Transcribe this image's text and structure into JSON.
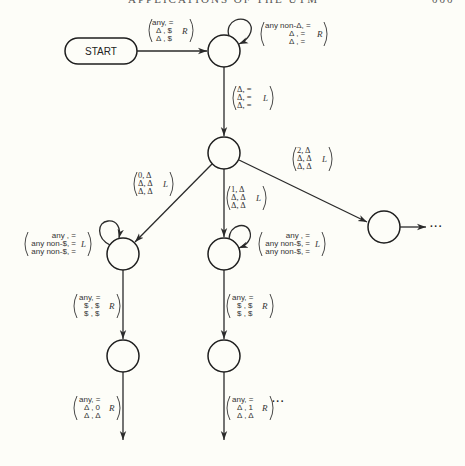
{
  "page": {
    "header_clipped": "APPLICATIONS OF THE UTM",
    "page_number_clipped": "000"
  },
  "diagram": {
    "type": "turing-machine-state-diagram",
    "start": {
      "label": "START"
    },
    "states": [
      {
        "id": "s1",
        "cx": 224,
        "cy": 51
      },
      {
        "id": "s2",
        "cx": 224,
        "cy": 153
      },
      {
        "id": "s3",
        "cx": 123,
        "cy": 254
      },
      {
        "id": "s4",
        "cx": 224,
        "cy": 254
      },
      {
        "id": "s5",
        "cx": 384,
        "cy": 227
      },
      {
        "id": "s6",
        "cx": 123,
        "cy": 356
      },
      {
        "id": "s7",
        "cx": 224,
        "cy": 356
      }
    ],
    "edges": {
      "start_to_s1": {
        "rows": [
          "any, =",
          "Δ , $",
          "Δ , $"
        ],
        "dir": "R"
      },
      "s1_loop": {
        "rows": [
          "any non-Δ, =",
          "Δ , =",
          "Δ , ="
        ],
        "dir": "R"
      },
      "s1_to_s2": {
        "rows": [
          "Δ, =",
          "Δ, =",
          "Δ, ="
        ],
        "dir": "L"
      },
      "s2_to_s3": {
        "rows": [
          "0, Δ",
          "Δ, Δ",
          "Δ, Δ"
        ],
        "dir": "L"
      },
      "s2_to_s4": {
        "rows": [
          "1, Δ",
          "Δ, Δ",
          "Δ, Δ"
        ],
        "dir": "L"
      },
      "s2_to_s5": {
        "rows": [
          "2, Δ",
          "Δ, Δ",
          "Δ, Δ"
        ],
        "dir": "L"
      },
      "s3_loop": {
        "rows": [
          "any , =",
          "any non-$, =",
          "any non-$, ="
        ],
        "dir": "L"
      },
      "s4_loop": {
        "rows": [
          "any , =",
          "any non-$, =",
          "any non-$, ="
        ],
        "dir": "L"
      },
      "s3_to_s6": {
        "rows": [
          "any, =",
          "$ , $",
          "$ , $"
        ],
        "dir": "R"
      },
      "s4_to_s7": {
        "rows": [
          "any, =",
          "$ , $",
          "$ , $"
        ],
        "dir": "R"
      },
      "s6_out": {
        "rows": [
          "any, =",
          "Δ , 0",
          "Δ , Δ"
        ],
        "dir": "R"
      },
      "s7_out": {
        "rows": [
          "any, =",
          "Δ , 1",
          "Δ , Δ"
        ],
        "dir": "R"
      }
    },
    "continuation": {
      "s5_out": "···",
      "s7_out": "···"
    }
  }
}
